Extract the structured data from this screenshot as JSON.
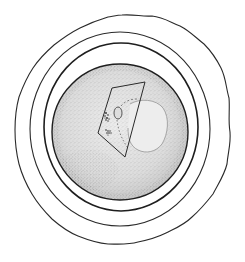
{
  "figure": {
    "canvas": {
      "width": 245,
      "height": 262,
      "background": "#ffffff"
    },
    "colors": {
      "ink": "#2a2a2a",
      "ink_light": "#555555",
      "stipple": "#3a3a3a",
      "sphere_fill": "#e2e2e2",
      "sphere_shade": "#cfcfcf",
      "nucleus_fill": "#ececec",
      "paper": "#ffffff"
    },
    "layers": [
      {
        "name": "outer-wavy-envelope",
        "cx": 122,
        "cy": 130,
        "rx": 107,
        "ry": 115
      },
      {
        "name": "ring-middle",
        "cx": 120,
        "cy": 129,
        "rx": 90,
        "ry": 97
      },
      {
        "name": "ring-inner",
        "cx": 121,
        "cy": 127,
        "rx": 77,
        "ry": 84
      },
      {
        "name": "stippled-sphere",
        "cx": 120,
        "cy": 132,
        "rx": 68,
        "ry": 68
      }
    ],
    "cutaway_plane": {
      "points": [
        [
          112,
          88
        ],
        [
          145,
          82
        ],
        [
          125,
          157
        ],
        [
          98,
          133
        ]
      ]
    },
    "nucleus": {
      "cx": 148,
      "cy": 126,
      "rx": 20,
      "ry": 26
    },
    "small_oval": {
      "cx": 118,
      "cy": 113,
      "rx": 4,
      "ry": 6
    },
    "alt_text": "Illustration of an egg cell with concentric layers"
  }
}
